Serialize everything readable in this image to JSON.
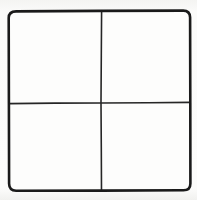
{
  "figure": {
    "shape_name": "square",
    "subdivision_label": "four equal quadrants",
    "line_color": "#1a1a1a",
    "fill_color": "#fdfdfc",
    "background_color": "#f6f6f4",
    "outer_border_width_px": 2.6,
    "inner_line_width_px": 1.6,
    "corner_radius_px": 7
  },
  "frame": {
    "name": "outer-square",
    "left_px": 9,
    "top_px": 11,
    "right_px": 190,
    "bottom_px": 190,
    "width_px": 181,
    "height_px": 179
  },
  "dividers": {
    "vertical": {
      "name": "vertical-divider",
      "x_px": 101,
      "y_start_px": 11,
      "y_end_px": 190
    },
    "horizontal": {
      "name": "horizontal-divider",
      "y_px": 103,
      "x_start_px": 9,
      "x_end_px": 190
    },
    "intersection": {
      "name": "center-intersection",
      "x_px": 101,
      "y_px": 103
    }
  },
  "quadrants": [
    {
      "id": "top-left",
      "label": "",
      "position": "upper-left",
      "left_px": 9,
      "top_px": 11,
      "width_px": 92,
      "height_px": 92
    },
    {
      "id": "top-right",
      "label": "",
      "position": "upper-right",
      "left_px": 101,
      "top_px": 11,
      "width_px": 89,
      "height_px": 92
    },
    {
      "id": "bottom-left",
      "label": "",
      "position": "lower-left",
      "left_px": 9,
      "top_px": 103,
      "width_px": 92,
      "height_px": 87
    },
    {
      "id": "bottom-right",
      "label": "",
      "position": "lower-right",
      "left_px": 101,
      "top_px": 103,
      "width_px": 89,
      "height_px": 87
    }
  ],
  "chart_data": {
    "type": "table",
    "xlabel": "",
    "ylabel": "",
    "categories": [
      "top-left",
      "top-right",
      "bottom-left",
      "bottom-right"
    ],
    "values": [
      1,
      1,
      1,
      1
    ],
    "grid": true,
    "legend": "none",
    "rows": 2,
    "columns": 2,
    "cell_contents": [
      [
        "",
        ""
      ],
      [
        "",
        ""
      ]
    ]
  }
}
